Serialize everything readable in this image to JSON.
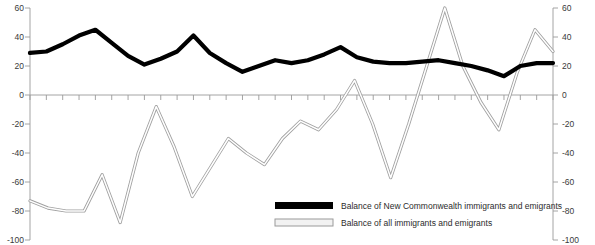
{
  "chart_data": {
    "type": "line",
    "title": "",
    "subtitle": "",
    "xlabel": "",
    "ylabel": "",
    "ylim": [
      -100,
      60
    ],
    "yticks": [
      60,
      40,
      20,
      0,
      -20,
      -40,
      -60,
      -80,
      -100
    ],
    "ytick_labels": [
      "60",
      "40",
      "20",
      "0",
      "-20",
      "-40",
      "-60",
      "-80",
      "-100"
    ],
    "right_axis": true,
    "right_ytick_labels": [
      "60",
      "40",
      "20",
      "0",
      "-20",
      "-40",
      "-60",
      "-80",
      "-100"
    ],
    "grid": false,
    "x_tick_count": 33,
    "xtick_labels": [],
    "legend_position": "bottom-right",
    "series": [
      {
        "name": "Balance of New Commonwealth immigrants and emigrants",
        "color": "#000000",
        "style": "thick-solid",
        "values": [
          29,
          30,
          35,
          41,
          45,
          36,
          27,
          21,
          25,
          30,
          41,
          29,
          22,
          16,
          20,
          24,
          22,
          24,
          28,
          33,
          26,
          23,
          22,
          22,
          23,
          24,
          22,
          20,
          17,
          13,
          20,
          22,
          22
        ]
      },
      {
        "name": "Balance of all immigrants and emigrants",
        "color": "#a0a0a0",
        "style": "thin-outline",
        "values": [
          -73,
          -78,
          -80,
          -80,
          -55,
          -88,
          -40,
          -8,
          -36,
          -70,
          -50,
          -30,
          -40,
          -48,
          -30,
          -18,
          -24,
          -10,
          10,
          -20,
          -57,
          -20,
          20,
          60,
          20,
          -5,
          -24,
          15,
          45,
          30
        ]
      }
    ]
  },
  "axes": {
    "left_ticks": [
      "60",
      "40",
      "20",
      "0",
      "-20",
      "-40",
      "-60",
      "-80",
      "-100"
    ],
    "right_ticks": [
      "60",
      "40",
      "20",
      "0",
      "-20",
      "-40",
      "-60",
      "-80",
      "-100"
    ]
  },
  "legend": {
    "items": [
      {
        "label": "Balance of New Commonwealth immigrants and emigrants",
        "swatch": "black-solid"
      },
      {
        "label": "Balance of all immigrants and emigrants",
        "swatch": "gray-outline"
      }
    ]
  }
}
